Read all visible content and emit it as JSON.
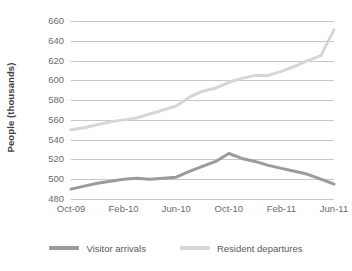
{
  "chart_data": {
    "type": "line",
    "title": "",
    "xlabel": "",
    "ylabel": "People (thousands)",
    "ylim": [
      480,
      660
    ],
    "ytick_step": 20,
    "yticks": [
      660,
      640,
      620,
      600,
      580,
      560,
      540,
      520,
      500,
      480
    ],
    "grid": true,
    "legend_position": "bottom",
    "x": [
      "Oct-09",
      "Nov-09",
      "Dec-09",
      "Jan-10",
      "Feb-10",
      "Mar-10",
      "Apr-10",
      "May-10",
      "Jun-10",
      "Jul-10",
      "Aug-10",
      "Sep-10",
      "Oct-10",
      "Nov-10",
      "Dec-10",
      "Jan-11",
      "Feb-11",
      "Mar-11",
      "Apr-11",
      "May-11",
      "Jun-11"
    ],
    "xtick_labels": [
      "Oct-09",
      "Feb-10",
      "Jun-10",
      "Oct-10",
      "Feb-11",
      "Jun-11"
    ],
    "xtick_indices": [
      0,
      4,
      8,
      12,
      16,
      20
    ],
    "series": [
      {
        "name": "Visitor arrivals",
        "color": "#9b9b9b",
        "values": [
          490,
          493,
          496,
          498,
          500,
          501,
          500,
          501,
          502,
          508,
          513,
          518,
          526,
          521,
          518,
          514,
          511,
          508,
          505,
          500,
          495
        ]
      },
      {
        "name": "Resident departures",
        "color": "#d6d6d6",
        "values": [
          550,
          552,
          555,
          558,
          560,
          562,
          566,
          570,
          574,
          583,
          589,
          592,
          598,
          602,
          605,
          605,
          609,
          614,
          620,
          625,
          651
        ]
      }
    ]
  },
  "legend": {
    "items": [
      {
        "label": "Visitor arrivals",
        "color": "#9b9b9b"
      },
      {
        "label": "Resident departures",
        "color": "#d6d6d6"
      }
    ]
  },
  "axes": {
    "y_title": "People (thousands)"
  },
  "colors": {
    "gridline": "#c8c8c8",
    "tick_text": "#6b6b6b",
    "title_text": "#404040",
    "background": "#ffffff"
  }
}
